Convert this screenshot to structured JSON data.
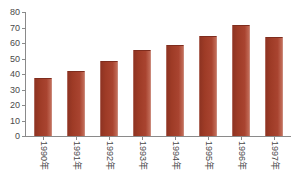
{
  "chart_data": {
    "type": "bar",
    "title": "",
    "xlabel": "",
    "ylabel": "",
    "categories": [
      "1990年",
      "1991年",
      "1992年",
      "1993年",
      "1994年",
      "1995年",
      "1996年",
      "1997年"
    ],
    "values": [
      37,
      41,
      48,
      55,
      58,
      64,
      71,
      63
    ],
    "ylim": [
      0,
      80
    ],
    "ytick_labels": [
      "80",
      "70",
      "60",
      "50",
      "40",
      "30",
      "20",
      "10",
      "0"
    ],
    "ytick_values": [
      80,
      70,
      60,
      50,
      40,
      30,
      20,
      10,
      0
    ],
    "grid": false,
    "legend": null,
    "series_color": "#9E3B26",
    "axis_color": "#8a8a8a",
    "text_color": "#4a4a4a",
    "background": "#ffffff",
    "xlabel_rotation_deg": 90
  },
  "artifacts": {
    "clipped_top_text": ""
  }
}
